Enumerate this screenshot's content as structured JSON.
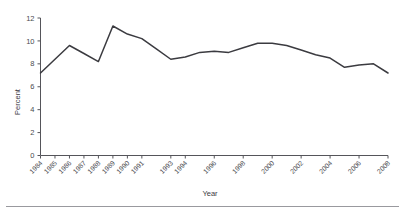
{
  "chart_data": {
    "type": "line",
    "title": "",
    "subtitle": "",
    "xlabel": "Year",
    "ylabel": "Percent",
    "grid": false,
    "legend": false,
    "legend_position": "none",
    "xlim": [
      1984,
      2008
    ],
    "ylim": [
      0,
      12
    ],
    "ytick_values": [
      0,
      2,
      4,
      6,
      8,
      10,
      12
    ],
    "ytick_labels": [
      "0",
      "2",
      "4",
      "6",
      "8",
      "10",
      "12"
    ],
    "x": [
      1984,
      1985,
      1986,
      1987,
      1988,
      1989,
      1990,
      1991,
      1992,
      1993,
      1994,
      1995,
      1996,
      1997,
      1998,
      1999,
      2000,
      2001,
      2002,
      2003,
      2004,
      2005,
      2006,
      2007,
      2008
    ],
    "xtick_values": [
      1984,
      1985,
      1986,
      1987,
      1988,
      1989,
      1990,
      1991,
      1993,
      1994,
      1996,
      1998,
      2000,
      2002,
      2004,
      2006,
      2008
    ],
    "xtick_labels": [
      "1984",
      "1985",
      "1986",
      "1987",
      "1988",
      "1989",
      "1990",
      "1991",
      "1993",
      "1994",
      "1996",
      "1998",
      "2000",
      "2002",
      "2004",
      "2006",
      "2008"
    ],
    "xtick_rotation": -45,
    "series": [
      {
        "name": "Percent",
        "color": "#3b3b40",
        "values": [
          7.2,
          8.4,
          9.6,
          8.9,
          8.2,
          11.3,
          10.6,
          10.2,
          9.3,
          8.4,
          8.6,
          9.0,
          9.1,
          9.0,
          9.4,
          9.8,
          9.8,
          9.6,
          9.2,
          8.8,
          8.5,
          7.7,
          7.9,
          8.0,
          7.2
        ]
      }
    ],
    "line_color": "#3b3b40",
    "axis_color": "#55555a",
    "background_color": "#ffffff"
  }
}
